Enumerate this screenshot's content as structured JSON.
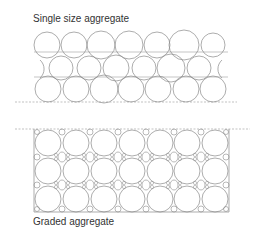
{
  "diagram": {
    "top_panel": {
      "title": "Single size aggregate",
      "rows": 3,
      "circles_per_row": [
        7,
        7,
        7
      ],
      "description": "uniform circles with large voids between them"
    },
    "bottom_panel": {
      "title": "Graded aggregate",
      "rows": 3,
      "columns": 7,
      "description": "large circles with smaller particles filling voids"
    },
    "colors": {
      "stroke": "#8a8a8a",
      "dash": "#999999",
      "text": "#333333"
    }
  }
}
